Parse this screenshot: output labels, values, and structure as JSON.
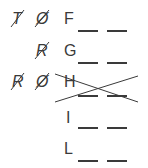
{
  "rows": [
    {
      "letter": "F",
      "crossed": [
        "T",
        "Ø"
      ]
    },
    {
      "letter": "G",
      "crossed": [
        "R"
      ]
    },
    {
      "letter": "H",
      "crossed": [
        "R",
        "Ø"
      ],
      "struck_out": true
    },
    {
      "letter": "I",
      "crossed": []
    },
    {
      "letter": "L",
      "crossed": []
    }
  ],
  "blank_count_per_row": 2,
  "ink_color": "#3a3a3a"
}
